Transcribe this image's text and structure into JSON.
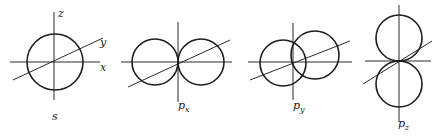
{
  "figure": {
    "panels": [
      {
        "id": "s",
        "label": "s",
        "subscript": "",
        "axes_labels": {
          "z": "z",
          "y": "y",
          "x": "x"
        }
      },
      {
        "id": "px",
        "label": "p",
        "subscript": "x"
      },
      {
        "id": "py",
        "label": "p",
        "subscript": "y"
      },
      {
        "id": "pz",
        "label": "p",
        "subscript": "z"
      }
    ],
    "colors": {
      "line": "#1e1e1e",
      "background": "#ffffff"
    }
  }
}
